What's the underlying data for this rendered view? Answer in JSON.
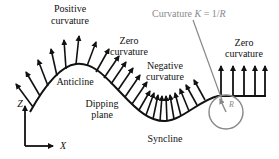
{
  "diagram": {
    "labels": {
      "positive_curvature": [
        "Positive",
        "curvature"
      ],
      "zero_curvature_left": [
        "Zero",
        "curvature"
      ],
      "negative_curvature": [
        "Negative",
        "curvature"
      ],
      "zero_curvature_right": [
        "Zero",
        "curvature"
      ],
      "anticline": "Anticline",
      "dipping_plane": [
        "Dipping",
        "plane"
      ],
      "syncline": "Syncline",
      "curvature_formula_prefix": "Curvature ",
      "curvature_formula_k": "K",
      "curvature_formula_eq": " = 1/",
      "curvature_formula_r": "R",
      "radius_label": "R",
      "axis_z": "Z",
      "axis_x": "X"
    },
    "colors": {
      "ink": "#111111",
      "annotation_gray": "#8a8a8a"
    }
  }
}
